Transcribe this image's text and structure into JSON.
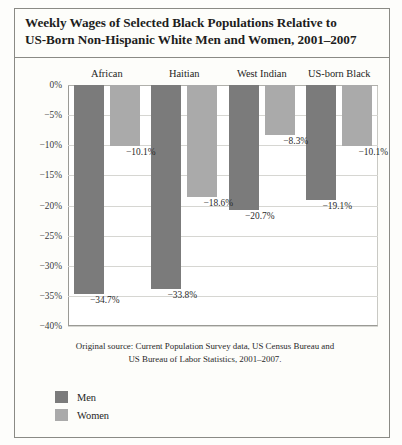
{
  "title": {
    "line1": "Weekly Wages of Selected Black Populations Relative to",
    "line2": "US-Born Non-Hispanic White Men and Women, 2001–2007"
  },
  "source_note": {
    "line1": "Original source: Current Population Survey data, US Census Bureau and",
    "line2": "US Bureau of Labor Statistics, 2001–2007."
  },
  "legend": {
    "items": [
      {
        "label": "Men",
        "color": "#7b7b7b"
      },
      {
        "label": "Women",
        "color": "#aaaaaa"
      }
    ]
  },
  "chart_data": {
    "type": "bar",
    "title": "Weekly Wages of Selected Black Populations Relative to US-Born Non-Hispanic White Men and Women, 2001–2007",
    "xlabel": "",
    "ylabel": "",
    "ylim": [
      -40,
      0
    ],
    "ytick_labels": [
      "0%",
      "−5%",
      "−10%",
      "−15%",
      "−20%",
      "−25%",
      "−30%",
      "−35%",
      "−40%"
    ],
    "ytick_values": [
      0,
      -5,
      -10,
      -15,
      -20,
      -25,
      -30,
      -35,
      -40
    ],
    "grid": true,
    "legend_position": "bottom-left",
    "categories": [
      "African",
      "Haitian",
      "West Indian",
      "US-born Black"
    ],
    "series": [
      {
        "name": "Men",
        "color": "#7b7b7b",
        "values": [
          -34.7,
          -33.8,
          -20.7,
          -19.1
        ],
        "labels": [
          "−34.7%",
          "−33.8%",
          "−20.7%",
          "−19.1%"
        ]
      },
      {
        "name": "Women",
        "color": "#aaaaaa",
        "values": [
          -10.1,
          -18.6,
          -8.3,
          -10.1
        ],
        "labels": [
          "−10.1%",
          "−18.6%",
          "−8.3%",
          "−10.1%"
        ]
      }
    ]
  }
}
